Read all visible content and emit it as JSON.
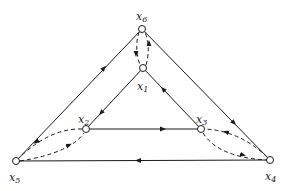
{
  "diagram": {
    "type": "directed-graph",
    "nodes": [
      {
        "id": "x1",
        "label": "x",
        "sub": "1",
        "x": 143,
        "y": 68,
        "lx": 138,
        "ly": 90
      },
      {
        "id": "x2",
        "label": "x",
        "sub": "2",
        "x": 86,
        "y": 129,
        "lx": 78,
        "ly": 122
      },
      {
        "id": "x3",
        "label": "x",
        "sub": "3",
        "x": 201,
        "y": 129,
        "lx": 196,
        "ly": 122
      },
      {
        "id": "x4",
        "label": "x",
        "sub": "4",
        "x": 270,
        "y": 160,
        "lx": 264,
        "ly": 178
      },
      {
        "id": "x5",
        "label": "x",
        "sub": "5",
        "x": 16,
        "y": 161,
        "lx": 10,
        "ly": 179
      },
      {
        "id": "x6",
        "label": "x",
        "sub": "6",
        "x": 142,
        "y": 29,
        "lx": 136,
        "ly": 19
      }
    ],
    "edges": [
      {
        "from": "x5",
        "to": "x6",
        "style": "solid"
      },
      {
        "from": "x6",
        "to": "x4",
        "style": "solid"
      },
      {
        "from": "x4",
        "to": "x5",
        "style": "solid"
      },
      {
        "from": "x1",
        "to": "x2",
        "style": "solid"
      },
      {
        "from": "x2",
        "to": "x3",
        "style": "solid"
      },
      {
        "from": "x3",
        "to": "x1",
        "style": "solid"
      },
      {
        "from": "x6",
        "to": "x1",
        "style": "dashed"
      },
      {
        "from": "x1",
        "to": "x6",
        "style": "dashed"
      },
      {
        "from": "x2",
        "to": "x5",
        "style": "dashed"
      },
      {
        "from": "x5",
        "to": "x2",
        "style": "dashed"
      },
      {
        "from": "x4",
        "to": "x3",
        "style": "dashed"
      },
      {
        "from": "x3",
        "to": "x4",
        "style": "dashed"
      }
    ],
    "colors": {
      "stroke": "#1a1a1a",
      "background": "#ffffff"
    }
  }
}
